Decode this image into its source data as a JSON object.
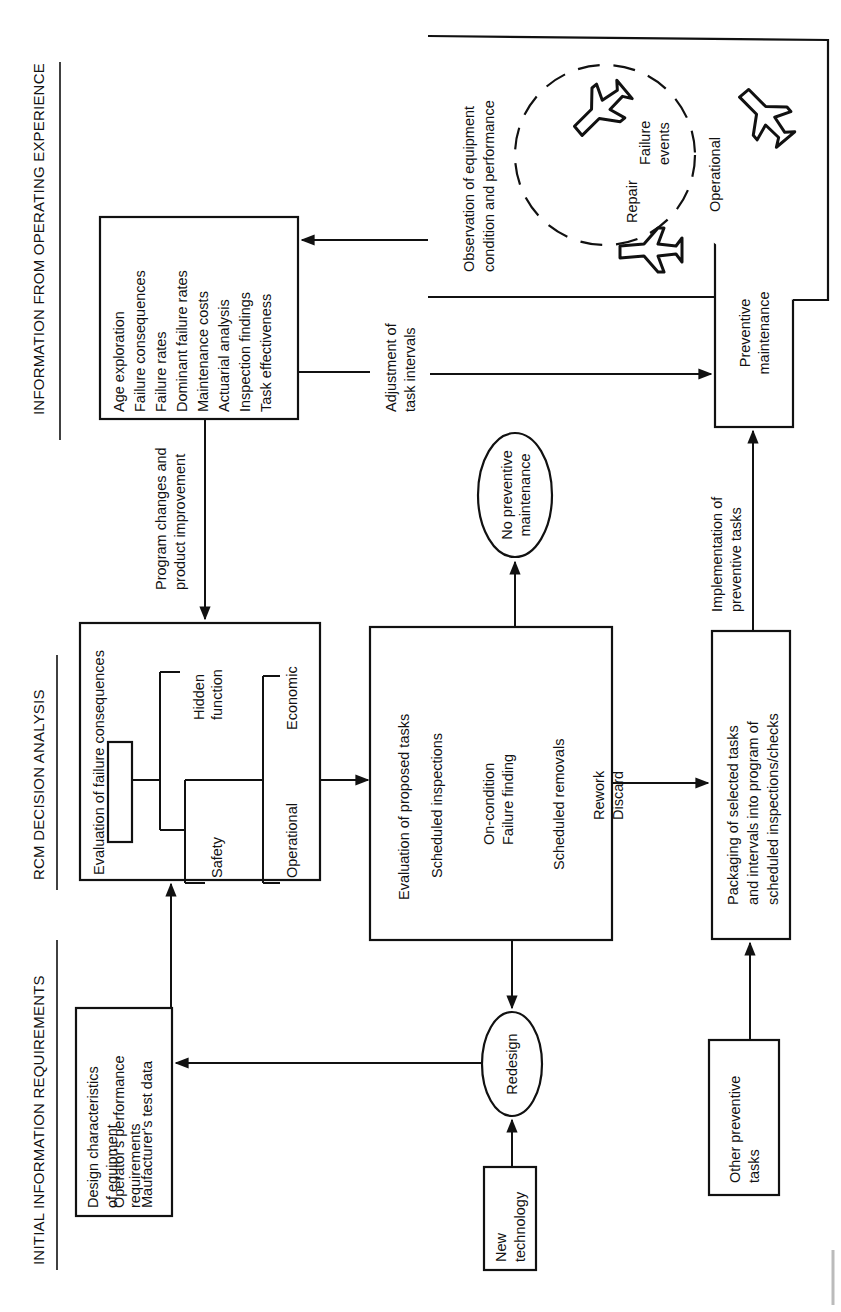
{
  "orientation": "rotated 90 degrees counter-clockwise",
  "headers": {
    "initial": "INITIAL INFORMATION REQUIREMENTS",
    "rcm": "RCM DECISION ANALYSIS",
    "operating": "INFORMATION FROM OPERATING EXPERIENCE"
  },
  "initial_requirements_box": {
    "lines": [
      "Design characteristics",
      "of equipment",
      "Operator's performance",
      "requirements",
      "Maufacturer's test data"
    ]
  },
  "failure_consequences_box": {
    "title": "Evaluation of failure consequences",
    "branches": [
      "Safety",
      "Hidden",
      "function",
      "Operational",
      "Economic"
    ]
  },
  "operating_info_box": {
    "lines": [
      "Age exploration",
      "Failure consequences",
      "Failure rates",
      "Dominant failure rates",
      "Maintenance costs",
      "Actuarial analysis",
      "Inspection findings",
      "Task effectiveness"
    ]
  },
  "proposed_tasks_box": {
    "lines": [
      "Evaluation of proposed tasks",
      "Scheduled inspections",
      "On-condition",
      "Failure finding",
      "Scheduled removals",
      "Rework",
      "Discard"
    ]
  },
  "no_pm_ellipse": {
    "lines": [
      "No preventive",
      "maintenance"
    ]
  },
  "redesign_ellipse": {
    "label": "Redesign"
  },
  "new_technology_box": {
    "lines": [
      "New",
      "technology"
    ]
  },
  "packaging_box": {
    "lines": [
      "Packaging of selected tasks",
      "and intervals into program of",
      "scheduled inspections/checks"
    ]
  },
  "other_tasks_box": {
    "lines": [
      "Other preventive",
      "tasks"
    ]
  },
  "preventive_maintenance_box": {
    "lines": [
      "Preventive",
      "maintenance"
    ]
  },
  "observation_box": {
    "lines": [
      "Observation of equipment",
      "condition and performance"
    ],
    "cycle_labels": {
      "repair": "Repair",
      "failure": "Failure",
      "events": "events",
      "operational": "Operational"
    }
  },
  "arrow_labels": {
    "program_changes": [
      "Program changes and",
      "product improvement"
    ],
    "adjustment": [
      "Adjustment of",
      "task intervals"
    ],
    "implementation": [
      "Implementation of",
      "preventive tasks"
    ]
  },
  "colors": {
    "ink": "#111111",
    "paper": "#ffffff"
  }
}
